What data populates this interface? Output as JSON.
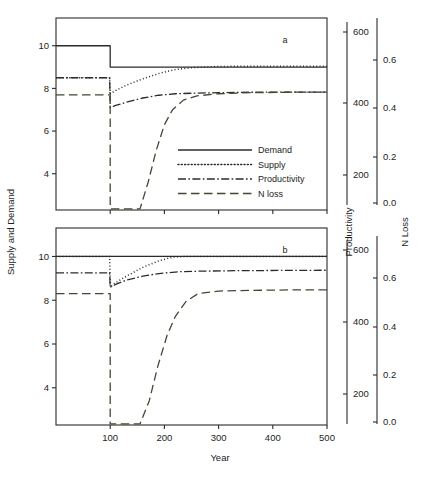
{
  "figure": {
    "background": "#ffffff",
    "ink": "#2b2b2b",
    "panel_labels": {
      "top": "a",
      "bottom": "b"
    }
  },
  "axes": {
    "x_label": "Year",
    "left_label": "Supply and Demand",
    "right_label_1": "Productivity",
    "right_label_2": "N Loss"
  },
  "legend": {
    "items": [
      {
        "label": "Demand",
        "style": "solid",
        "color": "#2b2b2b"
      },
      {
        "label": "Supply",
        "style": "dotted",
        "color": "#2b2b2b"
      },
      {
        "label": "Productivity",
        "style": "dashdot",
        "color": "#2b2b2b"
      },
      {
        "label": "N loss",
        "style": "dashed",
        "color": "#3f4a33"
      }
    ]
  },
  "chart_data": {
    "type": "line",
    "title": "",
    "xlabel": "Year",
    "ylabel": "Supply and Demand",
    "grid": false,
    "legend_position": "inside-lower-right-panel-a",
    "xlim": [
      0,
      500
    ],
    "xticks": [
      100,
      200,
      300,
      400,
      500
    ],
    "axes_right": [
      {
        "name": "Productivity",
        "lim": [
          100,
          660
        ],
        "ticks": [
          200,
          400,
          600
        ]
      },
      {
        "name": "N Loss",
        "lim": [
          -0.04,
          0.72
        ],
        "ticks": [
          0.0,
          0.2,
          0.4,
          0.6
        ],
        "ticklabels": [
          "0.0",
          "0.2",
          "0.4",
          "0.6"
        ]
      }
    ],
    "panels": [
      {
        "id": "a",
        "label": "a",
        "ylim": [
          2.3,
          11.3
        ],
        "yticks": [
          4,
          6,
          8,
          10
        ],
        "series": [
          {
            "name": "Demand",
            "style": "solid",
            "color": "#2b2b2b",
            "axis": "left",
            "x": [
              0,
              100,
              100,
              500
            ],
            "y": [
              10.0,
              10.0,
              9.0,
              9.0
            ]
          },
          {
            "name": "Supply",
            "style": "dotted",
            "color": "#2b2b2b",
            "axis": "left",
            "x": [
              0,
              99,
              100,
              110,
              130,
              160,
              190,
              220,
              250,
              290,
              340,
              400,
              500
            ],
            "y": [
              8.5,
              8.5,
              7.75,
              7.9,
              8.15,
              8.45,
              8.7,
              8.88,
              8.97,
              9.02,
              9.04,
              9.04,
              9.04
            ]
          },
          {
            "name": "Productivity",
            "style": "dashdot",
            "color": "#2b2b2b",
            "axis": "right-productivity",
            "x": [
              0,
              99,
              100,
              110,
              130,
              160,
              190,
              220,
              260,
              300,
              360,
              430,
              500
            ],
            "y_left_equiv": [
              8.5,
              8.5,
              7.1,
              7.2,
              7.35,
              7.55,
              7.68,
              7.75,
              7.78,
              7.8,
              7.82,
              7.83,
              7.83
            ]
          },
          {
            "name": "N loss",
            "style": "dashed",
            "color": "#3f4a33",
            "axis": "right-nloss",
            "x": [
              0,
              99,
              100,
              100,
              155,
              170,
              185,
              200,
              215,
              235,
              260,
              300,
              360,
              430,
              500
            ],
            "y_left_equiv": [
              7.7,
              7.7,
              7.7,
              2.35,
              2.35,
              3.6,
              5.1,
              6.3,
              7.0,
              7.45,
              7.65,
              7.75,
              7.8,
              7.82,
              7.83
            ]
          }
        ]
      },
      {
        "id": "b",
        "label": "b",
        "ylim": [
          2.3,
          11.3
        ],
        "yticks": [
          4,
          6,
          8,
          10
        ],
        "series": [
          {
            "name": "Demand",
            "style": "solid",
            "color": "#2b2b2b",
            "axis": "left",
            "x": [
              0,
              500
            ],
            "y": [
              10.0,
              10.0
            ]
          },
          {
            "name": "Supply",
            "style": "dotted",
            "color": "#2b2b2b",
            "axis": "left",
            "x": [
              0,
              99,
              100,
              110,
              130,
              160,
              190,
              215,
              240,
              280,
              340,
              420,
              500
            ],
            "y": [
              10.0,
              10.0,
              8.6,
              8.8,
              9.1,
              9.5,
              9.8,
              9.97,
              10.0,
              10.0,
              10.0,
              10.0,
              10.0
            ]
          },
          {
            "name": "Productivity",
            "style": "dashdot",
            "color": "#2b2b2b",
            "axis": "right-productivity",
            "x": [
              0,
              99,
              100,
              110,
              130,
              160,
              190,
              225,
              270,
              330,
              410,
              500
            ],
            "y_left_equiv": [
              9.25,
              9.25,
              8.6,
              8.72,
              8.92,
              9.1,
              9.22,
              9.3,
              9.33,
              9.35,
              9.36,
              9.37
            ]
          },
          {
            "name": "N loss",
            "style": "dashed",
            "color": "#3f4a33",
            "axis": "right-nloss",
            "x": [
              0,
              99,
              100,
              100,
              155,
              172,
              188,
              205,
              220,
              240,
              262,
              300,
              360,
              430,
              500
            ],
            "y_left_equiv": [
              8.3,
              8.3,
              8.3,
              2.35,
              2.35,
              3.4,
              5.0,
              6.4,
              7.25,
              7.95,
              8.3,
              8.42,
              8.45,
              8.47,
              8.47
            ]
          }
        ]
      }
    ]
  }
}
